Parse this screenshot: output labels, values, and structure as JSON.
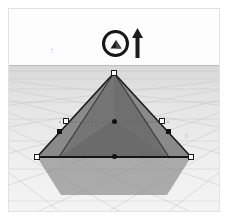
{
  "app": {
    "title": "3D Modeling Viewport",
    "scene_name": "pyramid-selection"
  },
  "viewport": {
    "width": 226,
    "height": 218,
    "background_color": "#ffffff",
    "sky_color": "#fdfdfd",
    "ground_color": "#e3e3e3",
    "horizon_color": "#bcbcbc",
    "grid_color": "#cfcfcf"
  },
  "cursor": {
    "tool_name": "scale-tool",
    "icon": "circle-pyramid-icon",
    "ring_color": "#161616",
    "x": 106,
    "y": 34
  },
  "axis_indicator": {
    "icon": "up-arrow-icon",
    "label": "",
    "color": "#1b1b1b",
    "direction": "up",
    "x": 128,
    "y": 34
  },
  "model": {
    "name": "pyramid",
    "selected": true,
    "face_color_left": "#6d6d6d",
    "face_color_right": "#848484",
    "face_color_front": "#747474",
    "outline_color": "#1c1c1c",
    "shadow_color": "#8d8d8d",
    "apex": {
      "x": 105,
      "y": 64
    },
    "base_left": {
      "x": 28,
      "y": 148
    },
    "base_right": {
      "x": 182,
      "y": 148
    }
  },
  "handles": {
    "square_label": "scale-handle",
    "dot_label": "center-point",
    "corner_handles": [
      {
        "name": "handle-apex",
        "x": 105,
        "y": 64
      },
      {
        "name": "handle-base-left",
        "x": 28,
        "y": 148
      },
      {
        "name": "handle-base-right",
        "x": 182,
        "y": 148
      },
      {
        "name": "handle-mid-left",
        "x": 57,
        "y": 112
      },
      {
        "name": "handle-mid-right",
        "x": 153,
        "y": 112
      }
    ],
    "dark_handles": [
      {
        "name": "handle-inner-left",
        "x": 50,
        "y": 122
      },
      {
        "name": "handle-inner-right",
        "x": 160,
        "y": 122
      }
    ],
    "center_dots": [
      {
        "name": "center-dot-upper",
        "x": 105,
        "y": 113
      },
      {
        "name": "center-dot-lower",
        "x": 105,
        "y": 148
      }
    ]
  },
  "annotations": {
    "left_mark": "ו",
    "right_mark": "ɔ"
  }
}
